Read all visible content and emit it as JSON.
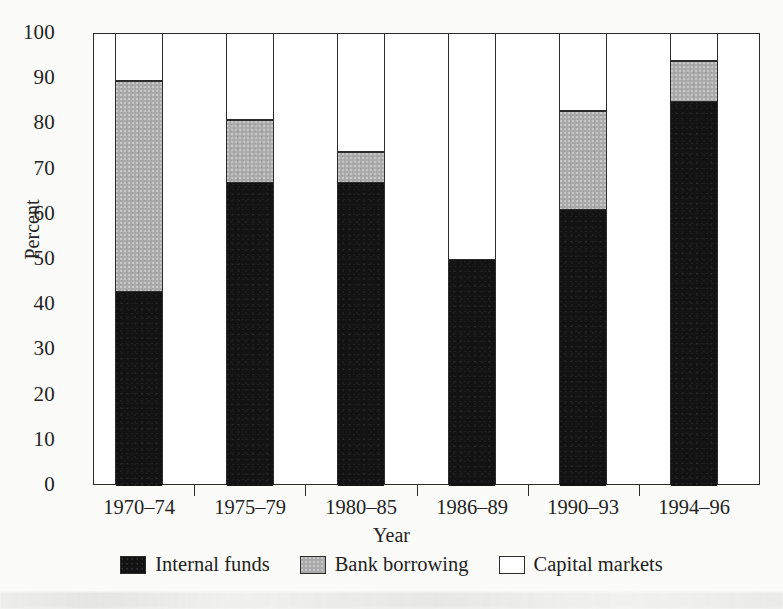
{
  "chart_data": {
    "type": "bar",
    "subtype": "stacked-100",
    "title": "",
    "xlabel": "Year",
    "ylabel": "Percent",
    "ylim": [
      0,
      100
    ],
    "yticks": [
      0,
      10,
      20,
      30,
      40,
      50,
      60,
      70,
      80,
      90,
      100
    ],
    "ytick_labels": [
      "0",
      "10",
      "20",
      "30",
      "40",
      "50",
      "60",
      "70",
      "80",
      "90",
      "100"
    ],
    "grid": false,
    "legend_position": "bottom",
    "categories": [
      "1970–74",
      "1975–79",
      "1980–85",
      "1986–89",
      "1990–93",
      "1994–96"
    ],
    "series": [
      {
        "name": "Internal funds",
        "color": "#131313",
        "values": [
          43,
          67,
          67,
          50,
          61,
          85
        ]
      },
      {
        "name": "Bank borrowing",
        "color": "#aaaaaa",
        "values": [
          46.5,
          14,
          7,
          0,
          22,
          9
        ]
      },
      {
        "name": "Capital markets",
        "color": "#ffffff",
        "values": [
          10.5,
          19,
          26,
          50,
          17,
          6
        ]
      }
    ],
    "cumulative_tops": {
      "internal_funds": [
        43,
        67,
        67,
        50,
        61,
        85
      ],
      "bank_borrowing": [
        89.5,
        81,
        74,
        50,
        83,
        94
      ],
      "capital_markets": [
        100,
        100,
        100,
        100,
        100,
        100
      ]
    }
  },
  "axes": {
    "y_title": "Percent",
    "x_title": "Year"
  },
  "legend": {
    "items": [
      {
        "label": "Internal funds",
        "swatch": "black-swatch"
      },
      {
        "label": "Bank borrowing",
        "swatch": "gray-swatch"
      },
      {
        "label": "Capital markets",
        "swatch": "white-swatch"
      }
    ]
  },
  "colors": {
    "internal_funds": "#131313",
    "bank_borrowing": "#aaaaaa",
    "capital_markets": "#ffffff",
    "axis": "#2b2b2b",
    "background": "#fbfbf9"
  }
}
